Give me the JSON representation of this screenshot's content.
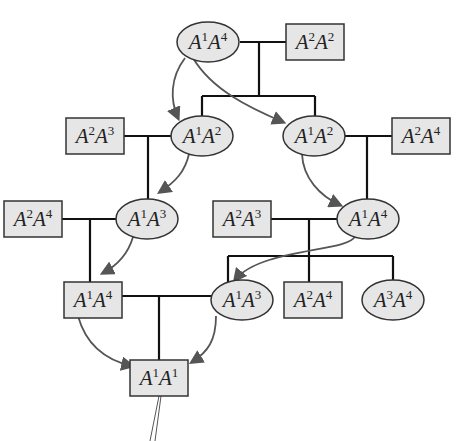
{
  "diagram": {
    "type": "pedigree",
    "colors": {
      "node_fill": "#e6e6e6",
      "line": "#111111",
      "arrow": "#555555"
    },
    "nodes": [
      {
        "id": "g1_female",
        "shape": "ellipse",
        "sex": "female",
        "allele1": "1",
        "allele2": "4",
        "label": "A1A4",
        "cx": 208,
        "cy": 42
      },
      {
        "id": "g1_male",
        "shape": "rect",
        "sex": "male",
        "allele1": "2",
        "allele2": "2",
        "label": "A2A2",
        "cx": 315,
        "cy": 42
      },
      {
        "id": "g2_left_mate",
        "shape": "rect",
        "sex": "male",
        "allele1": "2",
        "allele2": "3",
        "label": "A2A3",
        "cx": 95,
        "cy": 136
      },
      {
        "id": "g2_left",
        "shape": "ellipse",
        "sex": "female",
        "allele1": "1",
        "allele2": "2",
        "label": "A1A2",
        "cx": 202,
        "cy": 136
      },
      {
        "id": "g2_right",
        "shape": "ellipse",
        "sex": "female",
        "allele1": "1",
        "allele2": "2",
        "label": "A1A2",
        "cx": 314,
        "cy": 136
      },
      {
        "id": "g2_right_mate",
        "shape": "rect",
        "sex": "male",
        "allele1": "2",
        "allele2": "4",
        "label": "A2A4",
        "cx": 421,
        "cy": 136
      },
      {
        "id": "g3_left_mate",
        "shape": "rect",
        "sex": "male",
        "allele1": "2",
        "allele2": "4",
        "label": "A2A4",
        "cx": 33,
        "cy": 219
      },
      {
        "id": "g3_left",
        "shape": "ellipse",
        "sex": "female",
        "allele1": "1",
        "allele2": "3",
        "label": "A1A3",
        "cx": 147,
        "cy": 219
      },
      {
        "id": "g3_right_mate",
        "shape": "rect",
        "sex": "male",
        "allele1": "2",
        "allele2": "3",
        "label": "A2A3",
        "cx": 242,
        "cy": 219
      },
      {
        "id": "g3_right",
        "shape": "ellipse",
        "sex": "female",
        "allele1": "1",
        "allele2": "4",
        "label": "A1A4",
        "cx": 368,
        "cy": 219
      },
      {
        "id": "g4_left",
        "shape": "rect",
        "sex": "male",
        "allele1": "1",
        "allele2": "4",
        "label": "A1A4",
        "cx": 93,
        "cy": 300
      },
      {
        "id": "g4_mid_female",
        "shape": "ellipse",
        "sex": "female",
        "allele1": "1",
        "allele2": "3",
        "label": "A1A3",
        "cx": 242,
        "cy": 300
      },
      {
        "id": "g4_mid_male",
        "shape": "rect",
        "sex": "male",
        "allele1": "2",
        "allele2": "4",
        "label": "A2A4",
        "cx": 313,
        "cy": 300
      },
      {
        "id": "g4_right",
        "shape": "ellipse",
        "sex": "female",
        "allele1": "3",
        "allele2": "4",
        "label": "A3A4",
        "cx": 393,
        "cy": 300
      },
      {
        "id": "g5_child",
        "shape": "rect",
        "sex": "male",
        "allele1": "1",
        "allele2": "1",
        "label": "A1A1",
        "cx": 159,
        "cy": 378
      }
    ],
    "matings": [
      {
        "parents": [
          "g1_female",
          "g1_male"
        ],
        "children": [
          "g2_left",
          "g2_right"
        ]
      },
      {
        "parents": [
          "g2_left_mate",
          "g2_left"
        ],
        "children": [
          "g3_left"
        ]
      },
      {
        "parents": [
          "g2_right",
          "g2_right_mate"
        ],
        "children": [
          "g3_right"
        ]
      },
      {
        "parents": [
          "g3_left_mate",
          "g3_left"
        ],
        "children": [
          "g4_left"
        ]
      },
      {
        "parents": [
          "g3_right_mate",
          "g3_right"
        ],
        "children": [
          "g4_mid_female",
          "g4_mid_male",
          "g4_right"
        ]
      },
      {
        "parents": [
          "g4_left",
          "g4_mid_female"
        ],
        "children": [
          "g5_child"
        ]
      }
    ],
    "allele_transmission_arrows": [
      {
        "from": "g1_female",
        "to": "g2_left"
      },
      {
        "from": "g1_female",
        "to": "g2_right"
      },
      {
        "from": "g2_left",
        "to": "g3_left"
      },
      {
        "from": "g2_right",
        "to": "g3_right"
      },
      {
        "from": "g3_left",
        "to": "g4_left"
      },
      {
        "from": "g3_right",
        "to": "g4_mid_female"
      },
      {
        "from": "g4_left",
        "to": "g5_child"
      },
      {
        "from": "g4_mid_female",
        "to": "g5_child"
      }
    ]
  }
}
